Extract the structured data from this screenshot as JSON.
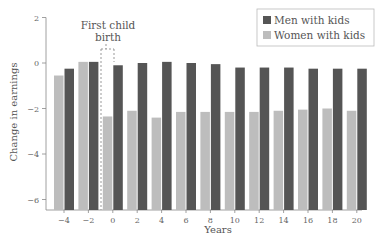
{
  "chart_data": {
    "type": "bar",
    "title": "",
    "xlabel": "Years",
    "ylabel": "Change in earnings",
    "ylim": [
      -6.5,
      2
    ],
    "yticks": [
      2,
      0,
      -2,
      -4,
      -6
    ],
    "categories": [
      -4,
      -2,
      0,
      2,
      4,
      6,
      8,
      10,
      12,
      14,
      16,
      18,
      20
    ],
    "series": [
      {
        "name": "Women with kids",
        "color": "#bdbdbd",
        "values": [
          -0.55,
          0.05,
          -2.35,
          -2.1,
          -2.4,
          -2.15,
          -2.15,
          -2.15,
          -2.15,
          -2.1,
          -2.05,
          -2.0,
          -2.1
        ]
      },
      {
        "name": "Men with kids",
        "color": "#555555",
        "values": [
          -0.25,
          0.05,
          -0.1,
          0.0,
          0.05,
          0.0,
          -0.05,
          -0.2,
          -0.2,
          -0.2,
          -0.25,
          -0.25,
          -0.25
        ]
      }
    ],
    "annotations": [
      {
        "text": "First child birth",
        "x": 0
      }
    ],
    "legend": {
      "position": "top-right",
      "entries": [
        "Men with kids",
        "Women with kids"
      ]
    },
    "grid": false
  },
  "labels": {
    "annotation_line1": "First child",
    "annotation_line2": "birth",
    "xlabel": "Years",
    "ylabel": "Change in earnings",
    "legend_men": "Men with kids",
    "legend_women": "Women with kids"
  }
}
